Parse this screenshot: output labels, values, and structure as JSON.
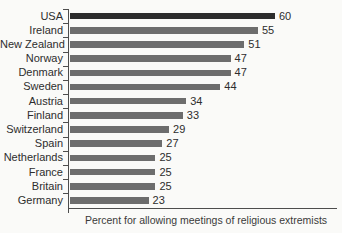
{
  "colors": {
    "background": "#fafaf8",
    "bar": "#6d6d6d",
    "bar_highlight": "#2c2c2c",
    "axis": "#4d4d4d",
    "label_text": "#2d2d2d",
    "value_text": "#2d2d2d",
    "xlabel_text": "#3a3a3a"
  },
  "chart_data": {
    "type": "bar",
    "orientation": "horizontal",
    "title": "",
    "xlabel": "Percent for allowing meetings of religious extremists",
    "ylabel": "",
    "categories": [
      "USA",
      "Ireland",
      "New Zealand",
      "Norway",
      "Denmark",
      "Sweden",
      "Austria",
      "Finland",
      "Switzerland",
      "Spain",
      "Netherlands",
      "France",
      "Britain",
      "Germany"
    ],
    "values": [
      60,
      55,
      51,
      47,
      47,
      44,
      34,
      33,
      29,
      27,
      25,
      25,
      25,
      23
    ],
    "highlighted_category": "USA",
    "value_labels_shown": true,
    "xlim": [
      0,
      80
    ],
    "grid": false,
    "legend": null
  }
}
